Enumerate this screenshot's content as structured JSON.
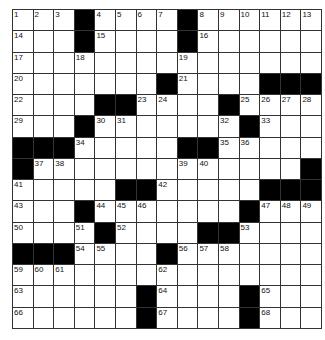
{
  "puzzle": {
    "rows": 15,
    "cols": 15,
    "colors": {
      "black_cell": "#000000",
      "white_cell": "#ffffff",
      "grid_line": "#333333"
    },
    "layout": [
      [
        "1",
        "2",
        "3",
        "#",
        "4",
        "5",
        "6",
        "7",
        "#",
        "8",
        "9",
        "10",
        "11",
        "12",
        "13"
      ],
      [
        "14",
        ".",
        ".",
        "#",
        "15",
        ".",
        ".",
        ".",
        "#",
        "16",
        ".",
        ".",
        ".",
        ".",
        "."
      ],
      [
        "17",
        ".",
        ".",
        "18",
        ".",
        ".",
        ".",
        ".",
        "19",
        ".",
        ".",
        ".",
        ".",
        ".",
        "."
      ],
      [
        "20",
        ".",
        ".",
        ".",
        ".",
        ".",
        ".",
        "#",
        "21",
        ".",
        ".",
        ".",
        "#",
        "#",
        "#"
      ],
      [
        "22",
        ".",
        ".",
        ".",
        "#",
        "#",
        "23",
        "24",
        ".",
        ".",
        "#",
        "25",
        "26",
        "27",
        "28"
      ],
      [
        "29",
        ".",
        ".",
        "#",
        "30",
        "31",
        ".",
        ".",
        ".",
        ".",
        "32",
        "#",
        "33",
        ".",
        "."
      ],
      [
        "#",
        "#",
        "#",
        "34",
        ".",
        ".",
        ".",
        ".",
        "#",
        "#",
        "35",
        "36",
        ".",
        ".",
        "."
      ],
      [
        "#",
        "37",
        "38",
        ".",
        ".",
        ".",
        ".",
        ".",
        "39",
        "40",
        ".",
        ".",
        ".",
        ".",
        "#"
      ],
      [
        "41",
        ".",
        ".",
        ".",
        ".",
        "#",
        "#",
        "42",
        ".",
        ".",
        ".",
        ".",
        "#",
        "#",
        "#"
      ],
      [
        "43",
        ".",
        ".",
        "#",
        "44",
        "45",
        "46",
        ".",
        ".",
        ".",
        ".",
        "#",
        "47",
        "48",
        "49"
      ],
      [
        "50",
        ".",
        ".",
        "51",
        "#",
        "52",
        ".",
        ".",
        ".",
        "#",
        "#",
        "53",
        ".",
        ".",
        "."
      ],
      [
        "#",
        "#",
        "#",
        "54",
        "55",
        ".",
        ".",
        "#",
        "56",
        "57",
        "58",
        ".",
        ".",
        ".",
        "."
      ],
      [
        "59",
        "60",
        "61",
        ".",
        ".",
        ".",
        ".",
        "62",
        ".",
        ".",
        ".",
        ".",
        ".",
        ".",
        "."
      ],
      [
        "63",
        ".",
        ".",
        ".",
        ".",
        ".",
        "#",
        "64",
        ".",
        ".",
        ".",
        "#",
        "65",
        ".",
        "."
      ],
      [
        "66",
        ".",
        ".",
        ".",
        ".",
        ".",
        "#",
        "67",
        ".",
        ".",
        ".",
        "#",
        "68",
        ".",
        "."
      ]
    ]
  }
}
